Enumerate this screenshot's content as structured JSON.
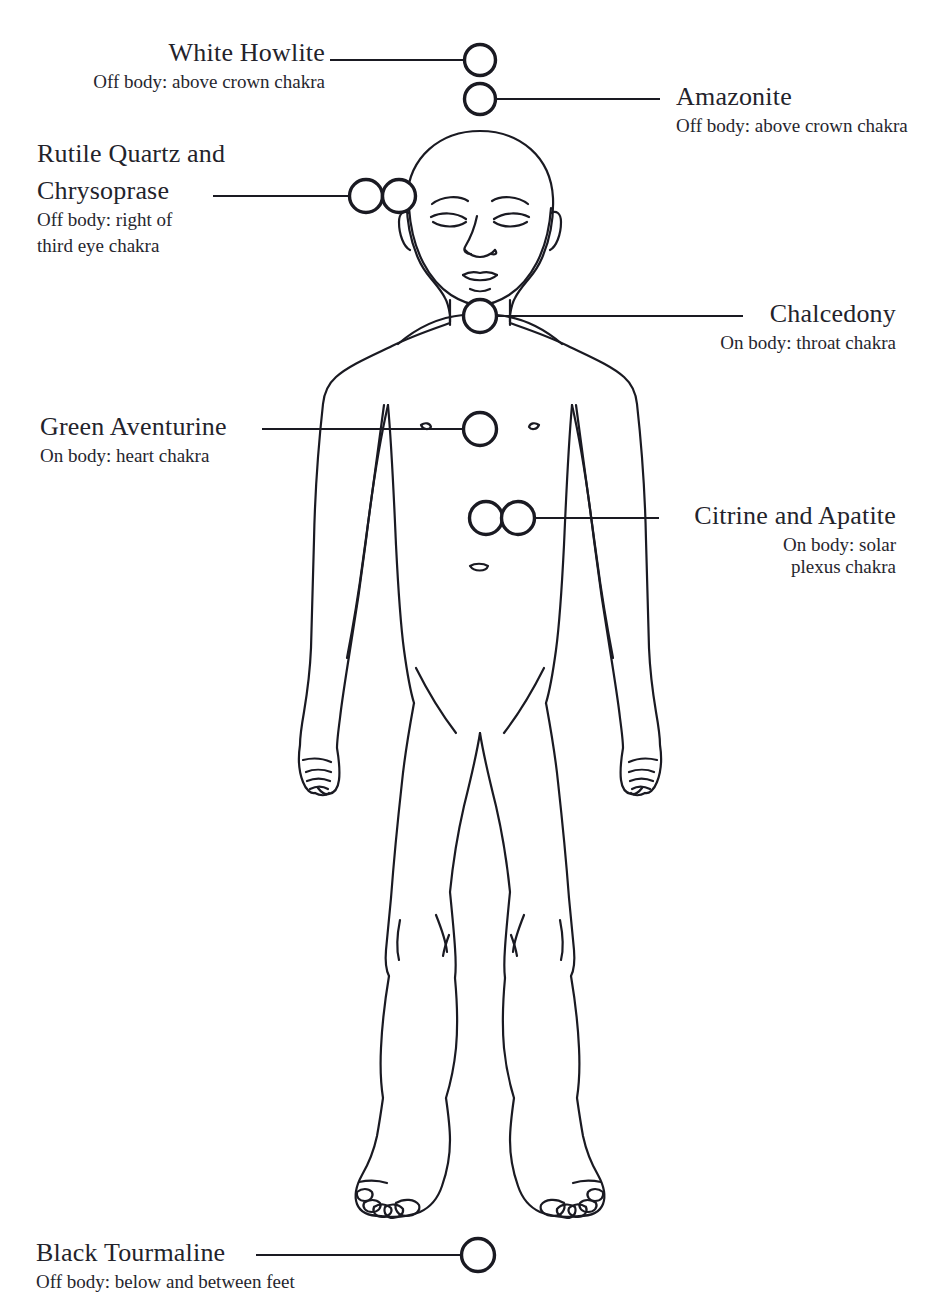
{
  "diagram": {
    "kind": "crystal-placement-body-map",
    "background_color": "#ffffff",
    "ink_color": "#1a1a22",
    "figure": "front-facing standing human line drawing, bald head, eyes closed, arms at sides"
  },
  "labels": [
    {
      "id": "white-howlite",
      "title": "White Howlite",
      "subtitle": "Off body: above crown chakra",
      "align": "right",
      "markers": 1
    },
    {
      "id": "amazonite",
      "title": "Amazonite",
      "subtitle": "Off body: above crown chakra",
      "align": "right",
      "markers": 1
    },
    {
      "id": "rutile-quartz-and-chrysoprase",
      "title": "Rutile Quartz and Chrysoprase",
      "title_line_1": "Rutile Quartz and",
      "title_line_2": "Chrysoprase",
      "subtitle": "Off body: right of third eye chakra",
      "subtitle_line_1": "Off body: right of",
      "subtitle_line_2": "third eye chakra",
      "align": "left",
      "markers": 2
    },
    {
      "id": "chalcedony",
      "title": "Chalcedony",
      "subtitle": "On body: throat chakra",
      "align": "right",
      "markers": 1
    },
    {
      "id": "green-aventurine",
      "title": "Green Aventurine",
      "subtitle": "On body: heart chakra",
      "align": "left",
      "markers": 1
    },
    {
      "id": "citrine-and-apatite",
      "title": "Citrine and Apatite",
      "subtitle": "On body: solar plexus chakra",
      "subtitle_line_1": "On body: solar",
      "subtitle_line_2": "plexus chakra",
      "align": "right",
      "markers": 2
    },
    {
      "id": "black-tourmaline",
      "title": "Black Tourmaline",
      "subtitle": "Off body: below and between feet",
      "align": "left",
      "markers": 1
    }
  ]
}
